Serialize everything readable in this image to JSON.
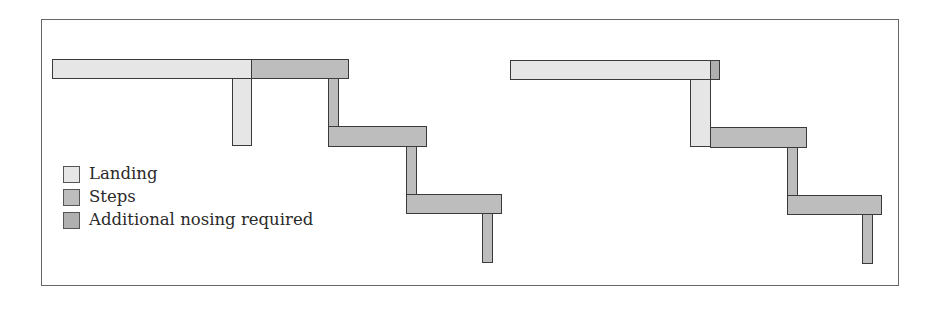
{
  "colors": {
    "landing": "#e6e6e6",
    "steps": "#bdbdbd",
    "nosing": "#b0b0b0",
    "outline": "#3a3a3a"
  },
  "legend": {
    "items": [
      {
        "label": "Landing",
        "swatch": "landing"
      },
      {
        "label": "Steps",
        "swatch": "steps"
      },
      {
        "label": "Additional nosing required",
        "swatch": "nosing"
      }
    ]
  },
  "diagrams": [
    {
      "name": "left-stair",
      "description": "Landing extends beyond riser; steps overlap"
    },
    {
      "name": "right-stair",
      "description": "Landing aligned with riser; small additional nosing piece"
    }
  ]
}
